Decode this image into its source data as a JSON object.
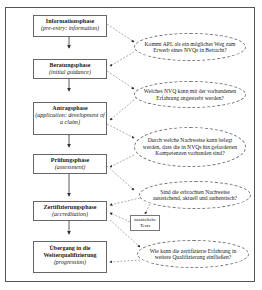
{
  "diagram": {
    "phases": [
      {
        "de": "Informationsphase",
        "en": "(pre-entry: information)"
      },
      {
        "de": "Beratungsphase",
        "en": "(initial guidance)"
      },
      {
        "de": "Antragsphase",
        "en": "(application: development of a claim)"
      },
      {
        "de": "Prüfungsphase",
        "en": "(assessment)"
      },
      {
        "de": "Zertifizierungsphase",
        "en": "(accreditation)"
      },
      {
        "de": "Übergang in die Weiterqualifizierung",
        "en": "(progression)"
      }
    ],
    "questions": [
      "Kommt APL als ein möglicher Weg zum Erwerb eines NVQs in Betracht?",
      "Welches NVQ kann mit der vorhandenen Erfahrung angestrebt werden?",
      "Durch welche Nachweise kann belegt werden, dass die in NVQs hin geforderten Kompetenzen vorhanden sind?",
      "Sind die erbrachten Nachweise ausreichend, aktuell und authentisch?",
      "Wie kann die zertifizierte Erfahrung in weitere Qualifizierung einfließen?"
    ],
    "note": "zusätzliche Tests"
  }
}
